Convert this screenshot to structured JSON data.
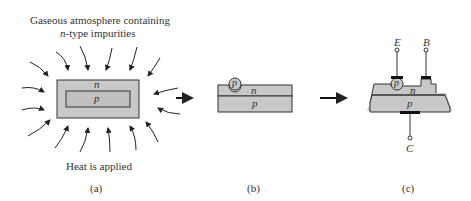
{
  "panel_a": {
    "title_line1": "Gaseous atmosphere containing",
    "title_line2_italic": "n",
    "title_line2_rest": "-type impurities",
    "outer_label": "n",
    "inner_label": "p",
    "bottom_caption": "Heat is applied",
    "sublabel": "(a)"
  },
  "panel_b": {
    "dot_label": "p",
    "upper_label": "n",
    "lower_label": "p",
    "sublabel": "(b)"
  },
  "panel_c": {
    "emitter_label": "E",
    "base_label": "B",
    "collector_label": "C",
    "dot_label": "p",
    "upper_label": "n",
    "lower_label": "p",
    "sublabel": "(c)"
  },
  "colors": {
    "fill": "#c8c8c8",
    "stroke": "#333333",
    "contact": "#111111"
  }
}
